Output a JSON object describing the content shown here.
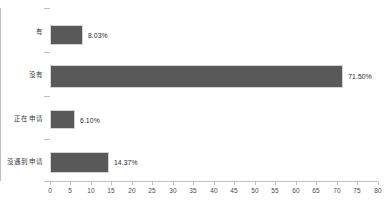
{
  "chart_data": {
    "type": "bar",
    "orientation": "horizontal",
    "title": "",
    "xlabel": "",
    "ylabel": "",
    "categories": [
      "有",
      "没有",
      "正在申请",
      "没遇到申请"
    ],
    "values": [
      8.03,
      71.5,
      6.1,
      14.37
    ],
    "value_labels": [
      "8.03%",
      "71.50%",
      "6.10%",
      "14.37%"
    ],
    "xlim": [
      0,
      80
    ],
    "xticks": [
      0,
      5,
      10,
      15,
      20,
      25,
      30,
      35,
      40,
      45,
      50,
      55,
      60,
      65,
      70,
      75,
      80
    ],
    "xtick_labels": [
      "0",
      "5",
      "10",
      "15",
      "20",
      "25",
      "30",
      "35",
      "40",
      "45",
      "50",
      "55",
      "60",
      "65",
      "70",
      "75",
      "80"
    ],
    "grid": false,
    "legend": null,
    "series": [
      {
        "name": "占比",
        "values": [
          8.03,
          71.5,
          6.1,
          14.37
        ],
        "color": "#595959"
      }
    ],
    "colors": {
      "bar_fill": "#595959",
      "bar_border": "#d4d4d4",
      "axis": "#bfbfbf",
      "tick_text": "#4a4a4a",
      "label_text": "#3a3a3a",
      "background": "#ffffff"
    }
  }
}
